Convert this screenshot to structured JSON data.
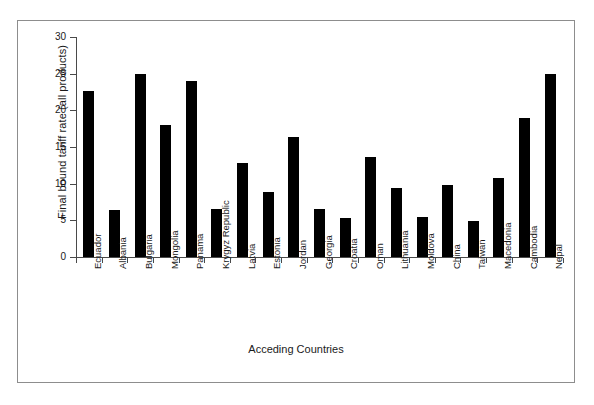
{
  "figure": {
    "frame_color": "#8d8d8d",
    "background": "#ffffff"
  },
  "chart_data": {
    "type": "bar",
    "title": "",
    "xlabel": "Acceding Countries",
    "ylabel": "Final bound tariff rate (all products)",
    "ylim": [
      0,
      30
    ],
    "ytick_values": [
      0,
      5,
      10,
      15,
      20,
      25,
      30
    ],
    "ytick_labels": [
      "0",
      "5",
      "10",
      "15",
      "20",
      "25",
      "30"
    ],
    "grid": false,
    "legend": null,
    "bar_color": "#000000",
    "categories": [
      "Ecuador",
      "Albania",
      "Bulgaria",
      "Mongolia",
      "Panama",
      "Krygyz Republic",
      "Latvia",
      "Estonia",
      "Jordan",
      "Georgia",
      "Croatia",
      "Oman",
      "Lithuania",
      "Moldova",
      "China",
      "Taiwan",
      "Macedonia",
      "Cambodia",
      "Nepal"
    ],
    "values": [
      22.6,
      6.4,
      25.0,
      18.0,
      24.0,
      6.6,
      12.8,
      8.8,
      16.4,
      6.6,
      5.3,
      13.7,
      9.4,
      5.4,
      9.8,
      4.9,
      10.8,
      19.0,
      25.0
    ]
  }
}
